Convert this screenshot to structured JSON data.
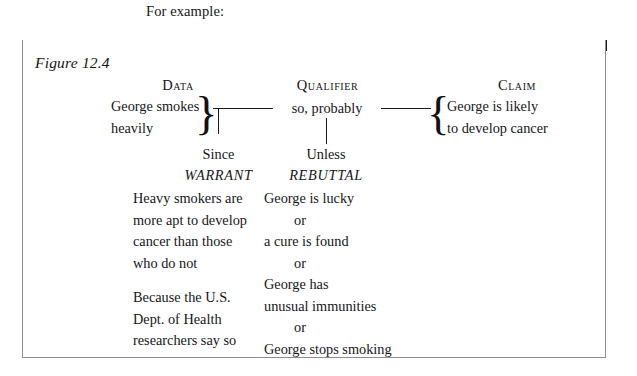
{
  "intro": {
    "text": "For example:"
  },
  "figure": {
    "caption": "Figure 12.4",
    "topbar_color": "#1b1b1b",
    "border_color": "#8e8e8e",
    "background_color": "#ffffff"
  },
  "diagram": {
    "data": {
      "header": "Data",
      "lines": [
        "George smokes",
        "heavily"
      ],
      "brace": "}"
    },
    "qualifier": {
      "header": "Qualifier",
      "text": "so, probably"
    },
    "claim": {
      "header": "Claim",
      "lines": [
        "George is likely",
        "to develop cancer"
      ],
      "brace": "{"
    },
    "warrant": {
      "connector": "Since",
      "header": "WARRANT",
      "lines": [
        "Heavy smokers are",
        "more apt to develop",
        "cancer than those",
        "who do not"
      ],
      "lines2": [
        "Because the U.S.",
        "Dept. of Health",
        "researchers say so"
      ]
    },
    "rebuttal": {
      "connector": "Unless",
      "header": "REBUTTAL",
      "lines": [
        "George is lucky",
        "or",
        "a cure is found",
        "or",
        "George has",
        "unusual immunities",
        "or",
        "George stops smoking"
      ]
    }
  }
}
